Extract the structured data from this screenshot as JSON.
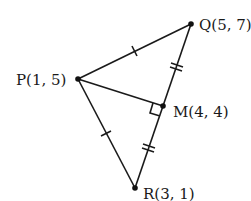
{
  "diagram": {
    "type": "geometry-triangle",
    "points": {
      "P": {
        "label": "P(1, 5)",
        "coords": [
          1,
          5
        ]
      },
      "Q": {
        "label": "Q(5, 7)",
        "coords": [
          5,
          7
        ]
      },
      "M": {
        "label": "M(4, 4)",
        "coords": [
          4,
          4
        ]
      },
      "R": {
        "label": "R(3, 1)",
        "coords": [
          3,
          1
        ]
      }
    },
    "segments": [
      {
        "from": "P",
        "to": "Q",
        "ticks": 1
      },
      {
        "from": "P",
        "to": "R",
        "ticks": 1
      },
      {
        "from": "Q",
        "to": "M",
        "ticks": 2
      },
      {
        "from": "M",
        "to": "R",
        "ticks": 2
      },
      {
        "from": "P",
        "to": "M",
        "ticks": 0
      }
    ],
    "right_angle_at": "M",
    "colors": {
      "stroke": "#1a1a1a",
      "background": "#ffffff"
    }
  }
}
